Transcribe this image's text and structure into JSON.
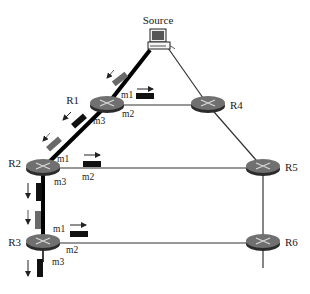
{
  "diagram": {
    "type": "multicast-routing-network",
    "source": {
      "label": "Source",
      "icon": "computer-icon"
    },
    "routers": [
      {
        "id": "R1",
        "label": "R1"
      },
      {
        "id": "R2",
        "label": "R2"
      },
      {
        "id": "R3",
        "label": "R3"
      },
      {
        "id": "R4",
        "label": "R4"
      },
      {
        "id": "R5",
        "label": "R5"
      },
      {
        "id": "R6",
        "label": "R6"
      }
    ],
    "interfaces": {
      "R1": {
        "m1": "m1",
        "m2": "m2",
        "m3": "m3"
      },
      "R2": {
        "m1": "m1",
        "m2": "m2",
        "m3": "m3"
      },
      "R3": {
        "m1": "m1",
        "m2": "m2",
        "m3": "m3"
      }
    },
    "links": [
      {
        "from": "Source",
        "to": "R1",
        "style": "thick"
      },
      {
        "from": "R1",
        "to": "R2",
        "style": "thick"
      },
      {
        "from": "R2",
        "to": "R3",
        "style": "thick"
      },
      {
        "from": "R3",
        "to": "below",
        "style": "thick"
      },
      {
        "from": "Source",
        "to": "R4",
        "style": "thin"
      },
      {
        "from": "R1",
        "to": "R4",
        "style": "thin"
      },
      {
        "from": "R4",
        "to": "R5",
        "style": "thin"
      },
      {
        "from": "R2",
        "to": "R5",
        "style": "thin"
      },
      {
        "from": "R5",
        "to": "R6",
        "style": "thin"
      },
      {
        "from": "R3",
        "to": "R6",
        "style": "thin"
      },
      {
        "from": "R6",
        "to": "below",
        "style": "thin"
      }
    ],
    "packets": [
      {
        "location": "Source-R1 link",
        "color": "gray",
        "direction": "toward R1"
      },
      {
        "location": "R1-R2 link",
        "color": "black",
        "direction": "toward R2"
      },
      {
        "location": "R1 m1",
        "color": "black",
        "direction": "outgoing right"
      },
      {
        "location": "R1-R2 link near R2",
        "color": "gray",
        "direction": "toward R2"
      },
      {
        "location": "R2 m1",
        "color": "black",
        "direction": "outgoing right"
      },
      {
        "location": "R2 m3",
        "color": "black",
        "direction": "down"
      },
      {
        "location": "R2-R3 link",
        "color": "gray",
        "direction": "down"
      },
      {
        "location": "R3 m1",
        "color": "black",
        "direction": "outgoing right"
      },
      {
        "location": "R3 m3",
        "color": "black",
        "direction": "down"
      }
    ],
    "colors": {
      "thick_link": "#000000",
      "thin_link": "#333333",
      "router_top": "#6e6e6e",
      "router_side": "#2b2b2b",
      "packet_black": "#111111",
      "packet_gray": "#6a6a6a"
    }
  }
}
